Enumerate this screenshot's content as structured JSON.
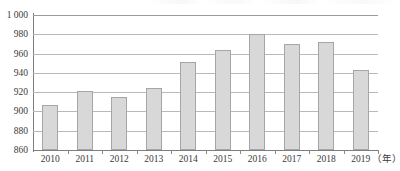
{
  "chart_data": {
    "type": "bar",
    "title": "",
    "subtitle": "",
    "xlabel": "（年）",
    "ylabel": "",
    "categories": [
      "2010",
      "2011",
      "2012",
      "2013",
      "2014",
      "2015",
      "2016",
      "2017",
      "2018",
      "2019"
    ],
    "values": [
      907,
      921,
      915,
      924,
      951,
      964,
      980,
      970,
      972,
      943
    ],
    "series": [
      {
        "name": "",
        "values": [
          907,
          921,
          915,
          924,
          951,
          964,
          980,
          970,
          972,
          943
        ]
      }
    ],
    "ylim": [
      860,
      1000
    ],
    "ytick_step": 20,
    "ytick_labels": [
      "1 000",
      "980",
      "960",
      "940",
      "920",
      "900",
      "880",
      "860"
    ],
    "ytick_values": [
      1000,
      980,
      960,
      940,
      920,
      900,
      880,
      860
    ],
    "grid": true,
    "grid_axis": "y",
    "legend": false,
    "legend_position": "none",
    "bar_color": "#d8d8d8",
    "bar_border_color": "#a6a6a6",
    "grid_color": "#b9b9b9",
    "axis_color": "#7d7d7d",
    "text_color": "#3a3a3a"
  },
  "axes": {
    "x_unit_label": "（年）"
  }
}
